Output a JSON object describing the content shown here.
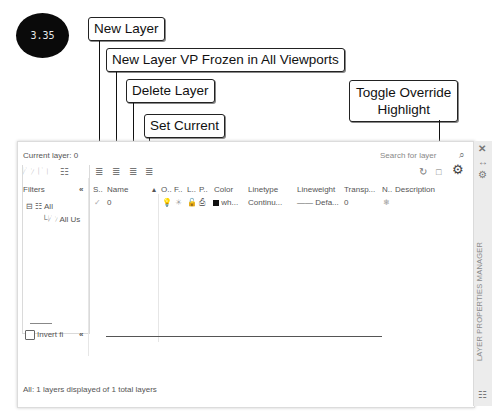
{
  "figure_badge": "3.35",
  "callouts": {
    "new_layer": "New Layer",
    "new_layer_vp_frozen": "New Layer VP Frozen in All Viewports",
    "delete_layer": "Delete Layer",
    "set_current": "Set Current",
    "toggle_override_line1": "Toggle Override",
    "toggle_override_line2": "Highlight"
  },
  "panel": {
    "current_layer": "Current layer: 0",
    "search_placeholder": "Search for layer",
    "filters_label": "Filters",
    "collapse_glyph": "«",
    "tree": {
      "all": "All",
      "all_used": "All Us"
    },
    "columns": [
      "S..",
      "Name",
      "▴",
      "O..",
      "F..",
      "L..",
      "P..",
      "Color",
      "Linetype",
      "Lineweight",
      "Transp...",
      "N..",
      "Description"
    ],
    "row": {
      "status": "✓",
      "name": "0",
      "color_name": "wh...",
      "linetype": "Continu...",
      "lineweight": "—— Defa...",
      "transparency": "0",
      "new_vp_freeze": "❄"
    },
    "invert_filter": "Invert fi",
    "status_bar": "All: 1 layers displayed of 1 total layers",
    "side_title": "LAYER PROPERTIES MANAGER",
    "side_icons": [
      "close-icon",
      "auto-hide-icon",
      "properties-icon"
    ]
  }
}
